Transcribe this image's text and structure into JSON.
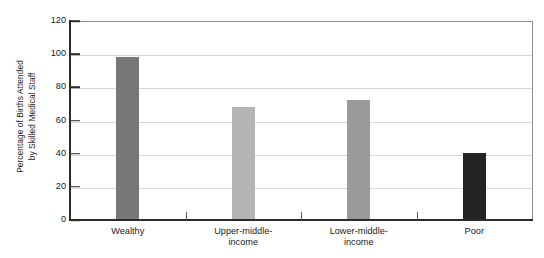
{
  "chart_data": {
    "type": "bar",
    "title": "",
    "xlabel": "",
    "ylabel": "Percentage of Births Attended by Skilled Medical Staff",
    "ylabel_lines": [
      "Percentage of Births Attended",
      "by Skilled Medical Staff"
    ],
    "categories": [
      "Wealthy",
      "Upper-middle-income",
      "Lower-middle-income",
      "Poor"
    ],
    "category_label_lines": [
      [
        "Wealthy"
      ],
      [
        "Upper-middle-",
        "income"
      ],
      [
        "Lower-middle-",
        "income"
      ],
      [
        "Poor"
      ]
    ],
    "values": [
      99,
      69,
      73,
      41
    ],
    "bar_colors": [
      "#777777",
      "#b5b5b5",
      "#9a9a9a",
      "#232323"
    ],
    "ylim": [
      0,
      120
    ],
    "yticks": [
      0,
      20,
      40,
      60,
      80,
      100,
      120
    ],
    "ytick_labels": [
      "0",
      "20",
      "40",
      "60",
      "80",
      "100",
      "120"
    ],
    "grid": true,
    "grid_axis": "y",
    "grid_color": "#d9d9d9",
    "legend": null,
    "legend_position": "none",
    "axis_color": "#2c2c2c",
    "frame_color": "#8e8e8e",
    "background_color": "#ffffff"
  }
}
